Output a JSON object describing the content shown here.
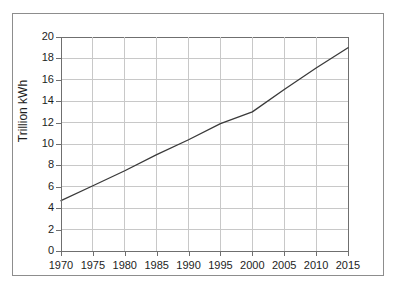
{
  "chart_data": {
    "type": "line",
    "title": "",
    "subtitle": "",
    "xlabel": "",
    "ylabel": "Trillion kWh",
    "xlim": [
      1970,
      2015
    ],
    "ylim": [
      0,
      20
    ],
    "grid": true,
    "legend": null,
    "x_ticks": [
      1970,
      1975,
      1980,
      1985,
      1990,
      1995,
      2000,
      2005,
      2010,
      2015
    ],
    "y_ticks": [
      0,
      2,
      4,
      6,
      8,
      10,
      12,
      14,
      16,
      18,
      20
    ],
    "x_tick_labels": [
      "1970",
      "1975",
      "1980",
      "1985",
      "1990",
      "1995",
      "2000",
      "2005",
      "2010",
      "2015"
    ],
    "y_tick_labels": [
      "0",
      "2",
      "4",
      "6",
      "8",
      "10",
      "12",
      "14",
      "16",
      "18",
      "20"
    ],
    "series": [
      {
        "name": "World electricity generation",
        "color": "#3a3a3a",
        "x": [
          1970,
          1975,
          1980,
          1985,
          1990,
          1995,
          2000,
          2005,
          2010,
          2015
        ],
        "values": [
          4.7,
          6.1,
          7.5,
          9.0,
          10.4,
          11.9,
          13.0,
          15.1,
          17.1,
          19.0
        ]
      }
    ],
    "colors": {
      "line": "#3a3a3a",
      "grid": "#c8c8c8",
      "axis": "#6f6f6f",
      "frame": "#8d8d8d",
      "text": "#1d1d1d",
      "background": "#ffffff"
    }
  }
}
